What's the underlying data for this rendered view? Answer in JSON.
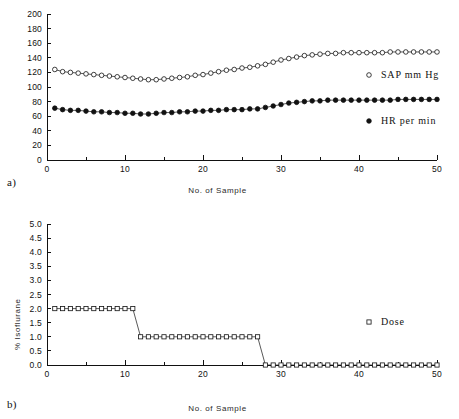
{
  "figure": {
    "panel_a_label": "a)",
    "panel_b_label": "b)"
  },
  "chart_data": [
    {
      "type": "line",
      "panel": "a",
      "title": "",
      "xlabel": "No. of Sample",
      "ylabel": "",
      "xlim": [
        0,
        50
      ],
      "ylim": [
        0,
        200
      ],
      "xticks": [
        0,
        10,
        20,
        30,
        40,
        50
      ],
      "xticklabels": [
        "0",
        "10",
        "20",
        "30",
        "40",
        "50"
      ],
      "yticks": [
        0,
        20,
        40,
        60,
        80,
        100,
        120,
        140,
        160,
        180,
        200
      ],
      "yticklabels": [
        "0",
        "20",
        "40",
        "60",
        "80",
        "100",
        "120",
        "140",
        "160",
        "180",
        "200"
      ],
      "xminor_step": 5,
      "grid": false,
      "legend_position": "right-inside",
      "x": [
        1,
        2,
        3,
        4,
        5,
        6,
        7,
        8,
        9,
        10,
        11,
        12,
        13,
        14,
        15,
        16,
        17,
        18,
        19,
        20,
        21,
        22,
        23,
        24,
        25,
        26,
        27,
        28,
        29,
        30,
        31,
        32,
        33,
        34,
        35,
        36,
        37,
        38,
        39,
        40,
        41,
        42,
        43,
        44,
        45,
        46,
        47,
        48,
        49,
        50
      ],
      "series": [
        {
          "name": "SAP mm Hg",
          "marker": "open-circle",
          "values": [
            124,
            121,
            120,
            119,
            118,
            117,
            116,
            115,
            114,
            113,
            112,
            111,
            110,
            110,
            111,
            112,
            113,
            114,
            116,
            117,
            119,
            121,
            123,
            124,
            126,
            127,
            129,
            131,
            134,
            137,
            139,
            141,
            143,
            144,
            145,
            146,
            146,
            147,
            147,
            147,
            147,
            147,
            147,
            148,
            148,
            148,
            148,
            148,
            148,
            148
          ]
        },
        {
          "name": "HR per min",
          "marker": "filled-circle",
          "values": [
            71,
            69,
            68,
            68,
            67,
            66,
            66,
            65,
            65,
            64,
            64,
            63,
            63,
            64,
            65,
            65,
            66,
            66,
            67,
            67,
            68,
            68,
            69,
            69,
            69,
            70,
            70,
            72,
            74,
            76,
            78,
            79,
            80,
            81,
            81,
            82,
            82,
            82,
            82,
            82,
            82,
            82,
            82,
            82,
            83,
            83,
            83,
            83,
            83,
            83
          ]
        }
      ]
    },
    {
      "type": "line",
      "panel": "b",
      "title": "",
      "xlabel": "No. of Sample",
      "ylabel": "% Isoflurane",
      "xlim": [
        0,
        50
      ],
      "ylim": [
        0,
        5
      ],
      "xticks": [
        0,
        10,
        20,
        30,
        40,
        50
      ],
      "xticklabels": [
        "0",
        "10",
        "20",
        "30",
        "40",
        "50"
      ],
      "yticks": [
        0.0,
        0.5,
        1.0,
        1.5,
        2.0,
        2.5,
        3.0,
        3.5,
        4.0,
        4.5,
        5.0
      ],
      "yticklabels": [
        "0.0",
        "0.5",
        "1.0",
        "1.5",
        "2.0",
        "2.5",
        "3.0",
        "3.5",
        "4.0",
        "4.5",
        "5.0"
      ],
      "xminor_step": 5,
      "grid": false,
      "legend_position": "right-inside",
      "x": [
        1,
        2,
        3,
        4,
        5,
        6,
        7,
        8,
        9,
        10,
        11,
        12,
        13,
        14,
        15,
        16,
        17,
        18,
        19,
        20,
        21,
        22,
        23,
        24,
        25,
        26,
        27,
        28,
        29,
        30,
        31,
        32,
        33,
        34,
        35,
        36,
        37,
        38,
        39,
        40,
        41,
        42,
        43,
        44,
        45,
        46,
        47,
        48,
        49,
        50
      ],
      "series": [
        {
          "name": "Dose",
          "marker": "open-square",
          "values": [
            2.0,
            2.0,
            2.0,
            2.0,
            2.0,
            2.0,
            2.0,
            2.0,
            2.0,
            2.0,
            2.0,
            1.0,
            1.0,
            1.0,
            1.0,
            1.0,
            1.0,
            1.0,
            1.0,
            1.0,
            1.0,
            1.0,
            1.0,
            1.0,
            1.0,
            1.0,
            1.0,
            0.0,
            0.0,
            0.0,
            0.0,
            0.0,
            0.0,
            0.0,
            0.0,
            0.0,
            0.0,
            0.0,
            0.0,
            0.0,
            0.0,
            0.0,
            0.0,
            0.0,
            0.0,
            0.0,
            0.0,
            0.0,
            0.0,
            0.0
          ]
        }
      ]
    }
  ]
}
